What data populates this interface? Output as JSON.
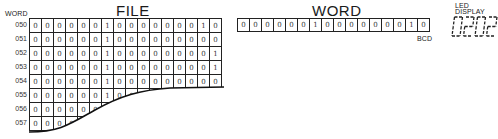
{
  "file": {
    "title": "FILE",
    "word_header": "WORD",
    "rows": [
      {
        "addr": "050",
        "bits": [
          "0",
          "0",
          "0",
          "0",
          "0",
          "0",
          "1",
          "0",
          "0",
          "0",
          "0",
          "0",
          "0",
          "0",
          "1",
          "0"
        ]
      },
      {
        "addr": "051",
        "bits": [
          "0",
          "0",
          "0",
          "0",
          "0",
          "0",
          "1",
          "0",
          "0",
          "0",
          "0",
          "0",
          "0",
          "0",
          "0",
          "0"
        ]
      },
      {
        "addr": "052",
        "bits": [
          "0",
          "0",
          "0",
          "0",
          "0",
          "0",
          "1",
          "0",
          "0",
          "0",
          "0",
          "0",
          "0",
          "0",
          "0",
          "1"
        ]
      },
      {
        "addr": "053",
        "bits": [
          "0",
          "0",
          "0",
          "0",
          "0",
          "0",
          "1",
          "0",
          "0",
          "0",
          "0",
          "0",
          "0",
          "0",
          "0",
          "1"
        ]
      },
      {
        "addr": "054",
        "bits": [
          "0",
          "0",
          "0",
          "0",
          "0",
          "0",
          "1",
          "0",
          "0",
          "0",
          "0",
          "0",
          "0",
          "0",
          "0",
          "0"
        ]
      },
      {
        "addr": "055",
        "bits": [
          "0",
          "0",
          "0",
          "0",
          "0",
          "0",
          "1",
          "0",
          "0",
          "",
          "",
          "",
          "",
          "",
          "",
          ""
        ]
      },
      {
        "addr": "056",
        "bits": [
          "0",
          "0",
          "0",
          "0",
          "0",
          "0",
          "",
          "",
          "",
          "",
          "",
          "",
          "",
          "",
          "",
          ""
        ]
      },
      {
        "addr": "057",
        "bits": [
          "0",
          "0",
          "0",
          "0",
          "",
          "",
          "",
          "",
          "",
          "",
          "",
          "",
          "",
          "",
          "",
          ""
        ]
      }
    ]
  },
  "word": {
    "title": "WORD",
    "bits": [
      "0",
      "0",
      "0",
      "0",
      "0",
      "0",
      "1",
      "0",
      "0",
      "0",
      "0",
      "0",
      "0",
      "0",
      "1",
      "0"
    ],
    "encoding_label": "BCD"
  },
  "led": {
    "label_line1": "LED",
    "label_line2": "DISPLAY",
    "value": "0202"
  }
}
